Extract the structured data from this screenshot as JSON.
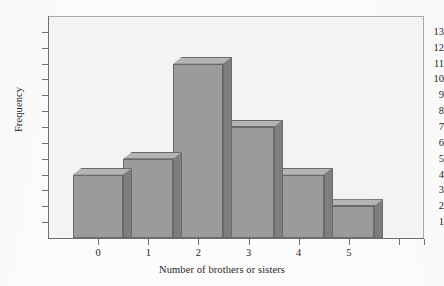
{
  "figure": {
    "kind": "histogram-figure"
  },
  "chart_data": {
    "type": "bar",
    "title": "",
    "subtitle": "",
    "xlabel": "Number of brothers or sisters",
    "ylabel": "Frequency",
    "categories": [
      "0",
      "1",
      "2",
      "3",
      "4",
      "5"
    ],
    "values": [
      4,
      5,
      11,
      7,
      4,
      2
    ],
    "series": [
      {
        "name": "Frequency",
        "values": [
          4,
          5,
          11,
          7,
          4,
          2
        ]
      }
    ],
    "bin_edges": [
      -0.5,
      0.5,
      1.5,
      2.5,
      3.5,
      4.5,
      5.5
    ],
    "x_tick_labels": [
      "0",
      "1",
      "2",
      "3",
      "4",
      "5"
    ],
    "y_tick_labels": [
      "1",
      "2",
      "3",
      "4",
      "5",
      "6",
      "7",
      "8",
      "9",
      "10",
      "11",
      "12",
      "13"
    ],
    "y_ticks": [
      1,
      2,
      3,
      4,
      5,
      6,
      7,
      8,
      9,
      10,
      11,
      12,
      13
    ],
    "ylim": [
      0,
      14
    ],
    "xlim": [
      -1,
      6.5
    ],
    "grid": false,
    "legend": false,
    "legend_position": "none",
    "style": "3d-blocks",
    "colors": {
      "bar_front": "#9b9b9b",
      "bar_top": "#b4b4b4",
      "bar_side": "#7e7e7e",
      "bar_edge": "#6a6a6a",
      "plot_background": "#f3f3f2",
      "page_background": "#fcfcfc",
      "axis": "#6e6e6e",
      "text": "#1f1f1f"
    }
  }
}
